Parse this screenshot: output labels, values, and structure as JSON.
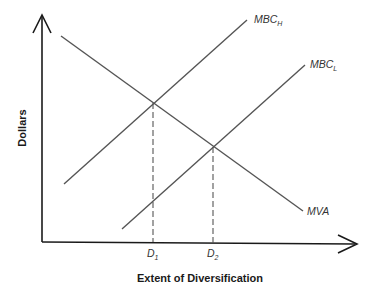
{
  "diagram": {
    "type": "economics-line-diagram",
    "x_axis": {
      "label": "Extent of Diversification",
      "ticks": [
        {
          "main": "D",
          "sub": "1"
        },
        {
          "main": "D",
          "sub": "2"
        }
      ]
    },
    "y_axis": {
      "label": "Dollars"
    },
    "curves": [
      {
        "name": "MBC",
        "sub": "H",
        "slope": "upward"
      },
      {
        "name": "MBC",
        "sub": "L",
        "slope": "upward"
      },
      {
        "name": "MVA",
        "sub": "",
        "slope": "downward"
      }
    ],
    "intersections": [
      {
        "curves": [
          "MVA",
          "MBC_H"
        ],
        "x_label": "D1"
      },
      {
        "curves": [
          "MVA",
          "MBC_L"
        ],
        "x_label": "D2"
      }
    ],
    "colors": {
      "axis": "#1a1a1a",
      "curve": "#555555"
    }
  }
}
